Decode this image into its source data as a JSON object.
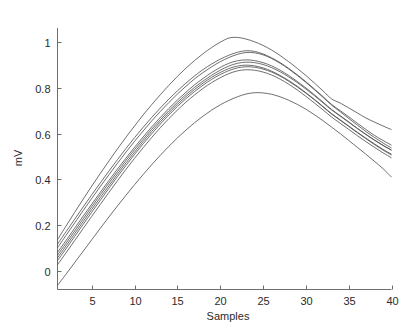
{
  "chart_data": {
    "type": "line",
    "title": "",
    "xlabel": "Samples",
    "ylabel": "mV",
    "xlim": [
      1,
      40
    ],
    "ylim": [
      -0.08,
      1.06
    ],
    "grid": false,
    "legend": false,
    "legend_position": "none",
    "x_ticks": [
      5,
      10,
      15,
      20,
      25,
      30,
      35,
      40
    ],
    "x_tick_labels": [
      "5",
      "10",
      "15",
      "20",
      "25",
      "30",
      "35",
      "40"
    ],
    "y_ticks": [
      0,
      0.2,
      0.4,
      0.6,
      0.8,
      1
    ],
    "y_tick_labels": [
      "0",
      "0.2",
      "0.4",
      "0.6",
      "0.8",
      "1"
    ],
    "x": [
      1,
      2,
      3,
      4,
      5,
      6,
      7,
      8,
      9,
      10,
      11,
      12,
      13,
      14,
      15,
      16,
      17,
      18,
      19,
      20,
      21,
      22,
      23,
      24,
      25,
      26,
      27,
      28,
      29,
      30,
      31,
      32,
      33,
      34,
      35,
      36,
      37,
      38,
      39,
      40
    ],
    "series": [
      {
        "name": "curve-1",
        "values": [
          0.137,
          0.197,
          0.256,
          0.314,
          0.371,
          0.426,
          0.48,
          0.533,
          0.584,
          0.633,
          0.681,
          0.726,
          0.769,
          0.81,
          0.849,
          0.885,
          0.918,
          0.948,
          0.975,
          0.998,
          1.016,
          1.019,
          1.012,
          1.0,
          0.984,
          0.964,
          0.94,
          0.913,
          0.884,
          0.853,
          0.82,
          0.786,
          0.751,
          0.733,
          0.712,
          0.69,
          0.668,
          0.65,
          0.633,
          0.617
        ]
      },
      {
        "name": "curve-2",
        "values": [
          0.118,
          0.172,
          0.226,
          0.28,
          0.333,
          0.385,
          0.436,
          0.486,
          0.535,
          0.582,
          0.627,
          0.67,
          0.711,
          0.75,
          0.786,
          0.82,
          0.851,
          0.879,
          0.903,
          0.924,
          0.941,
          0.954,
          0.961,
          0.958,
          0.947,
          0.93,
          0.909,
          0.884,
          0.856,
          0.826,
          0.794,
          0.761,
          0.727,
          0.7,
          0.673,
          0.645,
          0.618,
          0.592,
          0.57,
          0.549
        ]
      },
      {
        "name": "curve-3",
        "values": [
          0.102,
          0.156,
          0.21,
          0.264,
          0.317,
          0.369,
          0.42,
          0.47,
          0.519,
          0.566,
          0.611,
          0.655,
          0.696,
          0.735,
          0.772,
          0.806,
          0.838,
          0.866,
          0.891,
          0.913,
          0.931,
          0.945,
          0.953,
          0.952,
          0.943,
          0.927,
          0.906,
          0.881,
          0.853,
          0.823,
          0.791,
          0.758,
          0.724,
          0.695,
          0.666,
          0.637,
          0.609,
          0.583,
          0.559,
          0.537
        ]
      },
      {
        "name": "curve-4",
        "values": [
          0.082,
          0.134,
          0.187,
          0.24,
          0.292,
          0.344,
          0.395,
          0.445,
          0.493,
          0.54,
          0.585,
          0.629,
          0.67,
          0.709,
          0.746,
          0.78,
          0.812,
          0.84,
          0.866,
          0.888,
          0.906,
          0.917,
          0.921,
          0.918,
          0.909,
          0.895,
          0.876,
          0.853,
          0.827,
          0.799,
          0.769,
          0.737,
          0.705,
          0.678,
          0.651,
          0.623,
          0.597,
          0.572,
          0.549,
          0.528
        ]
      },
      {
        "name": "curve-5",
        "values": [
          0.07,
          0.122,
          0.175,
          0.228,
          0.281,
          0.333,
          0.384,
          0.434,
          0.483,
          0.53,
          0.575,
          0.619,
          0.66,
          0.699,
          0.736,
          0.77,
          0.801,
          0.829,
          0.854,
          0.876,
          0.894,
          0.906,
          0.911,
          0.909,
          0.901,
          0.887,
          0.869,
          0.847,
          0.822,
          0.794,
          0.765,
          0.734,
          0.703,
          0.676,
          0.649,
          0.622,
          0.596,
          0.571,
          0.548,
          0.527
        ]
      },
      {
        "name": "curve-6",
        "values": [
          0.058,
          0.11,
          0.163,
          0.216,
          0.269,
          0.321,
          0.372,
          0.423,
          0.472,
          0.519,
          0.565,
          0.609,
          0.651,
          0.69,
          0.727,
          0.761,
          0.792,
          0.82,
          0.845,
          0.866,
          0.883,
          0.894,
          0.898,
          0.895,
          0.886,
          0.872,
          0.853,
          0.831,
          0.806,
          0.778,
          0.749,
          0.718,
          0.687,
          0.66,
          0.633,
          0.606,
          0.58,
          0.555,
          0.531,
          0.51
        ]
      },
      {
        "name": "curve-7",
        "values": [
          0.046,
          0.098,
          0.151,
          0.204,
          0.257,
          0.309,
          0.361,
          0.412,
          0.461,
          0.509,
          0.555,
          0.599,
          0.641,
          0.681,
          0.718,
          0.752,
          0.783,
          0.811,
          0.836,
          0.857,
          0.874,
          0.886,
          0.891,
          0.889,
          0.881,
          0.868,
          0.85,
          0.828,
          0.803,
          0.776,
          0.747,
          0.716,
          0.685,
          0.658,
          0.631,
          0.604,
          0.578,
          0.552,
          0.528,
          0.506
        ]
      },
      {
        "name": "curve-8",
        "values": [
          0.028,
          0.08,
          0.133,
          0.186,
          0.239,
          0.291,
          0.343,
          0.394,
          0.444,
          0.492,
          0.538,
          0.583,
          0.625,
          0.665,
          0.702,
          0.737,
          0.768,
          0.797,
          0.822,
          0.843,
          0.861,
          0.873,
          0.878,
          0.876,
          0.868,
          0.855,
          0.837,
          0.815,
          0.79,
          0.762,
          0.733,
          0.703,
          0.672,
          0.645,
          0.618,
          0.591,
          0.565,
          0.54,
          0.516,
          0.494
        ]
      },
      {
        "name": "curve-9",
        "values": [
          -0.062,
          -0.013,
          0.037,
          0.087,
          0.137,
          0.187,
          0.236,
          0.284,
          0.331,
          0.377,
          0.421,
          0.464,
          0.505,
          0.544,
          0.581,
          0.615,
          0.647,
          0.676,
          0.702,
          0.725,
          0.744,
          0.76,
          0.772,
          0.778,
          0.777,
          0.771,
          0.76,
          0.745,
          0.727,
          0.706,
          0.682,
          0.656,
          0.628,
          0.6,
          0.57,
          0.54,
          0.51,
          0.479,
          0.447,
          0.41
        ]
      }
    ]
  },
  "figure": {
    "background_color": "#ffffff",
    "line_color": "#4a4a4a",
    "axis_color": "#6e6e6e",
    "text_color": "#2b2b2b"
  }
}
